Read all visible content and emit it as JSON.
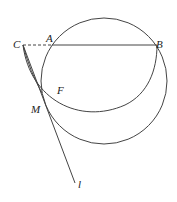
{
  "diagram": {
    "type": "geometry-figure",
    "points": {
      "C": {
        "label": "C",
        "x": 23,
        "y": 45
      },
      "A": {
        "label": "A",
        "x": 52,
        "y": 45
      },
      "B": {
        "label": "B",
        "x": 157,
        "y": 45
      },
      "M": {
        "label": "M",
        "x": 42,
        "y": 93
      },
      "F": {
        "label": "F",
        "x": 59,
        "y": 90
      }
    },
    "line_label": "l",
    "elements": [
      {
        "kind": "circle",
        "name": "large-circle",
        "through": [
          "A",
          "B",
          "M"
        ]
      },
      {
        "kind": "arc",
        "name": "arc-CB",
        "from": "C",
        "to": "B",
        "through": "M"
      },
      {
        "kind": "segment",
        "name": "segment-AB",
        "from": "A",
        "to": "B",
        "style": "solid"
      },
      {
        "kind": "segment",
        "name": "segment-CA",
        "from": "C",
        "to": "A",
        "style": "dashed"
      },
      {
        "kind": "ray",
        "name": "line-l",
        "from": "C",
        "through": "M",
        "label": "l"
      },
      {
        "kind": "curve",
        "name": "curve-CM",
        "from": "C",
        "to": "M"
      }
    ],
    "stroke_color": "#444444",
    "background": "#ffffff"
  }
}
